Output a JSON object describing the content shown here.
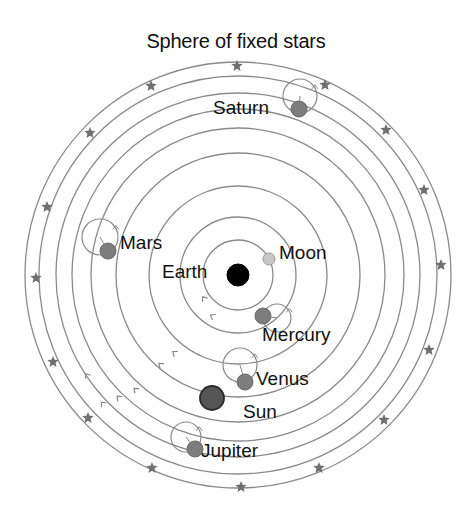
{
  "title": "Sphere of fixed stars",
  "center": {
    "x": 238,
    "y": 275
  },
  "colors": {
    "orbit": "#8a8a8a",
    "star": "#707070",
    "earth": "#000000",
    "moon": "#c8c8c8",
    "planet": "#7d7d7d",
    "sun": "#555555",
    "text": "#111111"
  },
  "orbits": [
    35,
    58,
    89,
    122,
    147,
    166,
    182,
    199,
    213
  ],
  "stars": [
    [
      237,
      66
    ],
    [
      151,
      86
    ],
    [
      90,
      133
    ],
    [
      47,
      207
    ],
    [
      36,
      278
    ],
    [
      53,
      362
    ],
    [
      88,
      418
    ],
    [
      152,
      468
    ],
    [
      241,
      487
    ],
    [
      319,
      468
    ],
    [
      384,
      420
    ],
    [
      429,
      350
    ],
    [
      441,
      265
    ],
    [
      424,
      190
    ],
    [
      386,
      130
    ],
    [
      325,
      85
    ]
  ],
  "bodies": {
    "earth": {
      "label": "Earth",
      "x": 238,
      "y": 275,
      "r": 11,
      "label_x": 162,
      "label_y": 262
    },
    "moon": {
      "label": "Moon",
      "x": 269,
      "y": 259,
      "r": 6,
      "label_x": 279,
      "label_y": 243
    },
    "mercury": {
      "label": "Mercury",
      "x": 263,
      "y": 316,
      "r": 8,
      "label_x": 262,
      "label_y": 325,
      "epi_x": 277,
      "epi_y": 318,
      "epi_r": 14
    },
    "venus": {
      "label": "Venus",
      "x": 245,
      "y": 382,
      "r": 8,
      "label_x": 256,
      "label_y": 369,
      "epi_x": 240,
      "epi_y": 365,
      "epi_r": 17
    },
    "sun": {
      "label": "Sun",
      "x": 212,
      "y": 398,
      "r": 12,
      "label_x": 243,
      "label_y": 402
    },
    "mars": {
      "label": "Mars",
      "x": 108,
      "y": 251,
      "r": 8,
      "label_x": 120,
      "label_y": 233,
      "epi_x": 100,
      "epi_y": 237,
      "epi_r": 18
    },
    "jupiter": {
      "label": "Jupiter",
      "x": 195,
      "y": 449,
      "r": 8,
      "label_x": 201,
      "label_y": 441,
      "epi_x": 186,
      "epi_y": 437,
      "epi_r": 15
    },
    "saturn": {
      "label": "Saturn",
      "x": 299,
      "y": 109,
      "r": 8,
      "label_x": 213,
      "label_y": 98,
      "epi_x": 300,
      "epi_y": 96,
      "epi_r": 17
    }
  },
  "orbit_arrows": [
    [
      205,
      300
    ],
    [
      214,
      317
    ],
    [
      176,
      354
    ],
    [
      162,
      366
    ],
    [
      137,
      391
    ],
    [
      120,
      399
    ],
    [
      104,
      405
    ],
    [
      88,
      377
    ]
  ]
}
